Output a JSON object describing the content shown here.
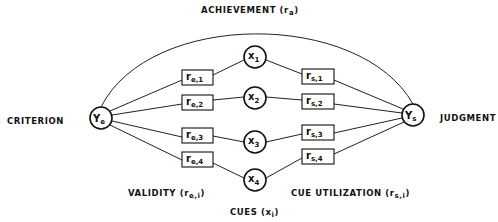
{
  "labels": {
    "achievement": "ACHIEVEMENT (r",
    "achievement_sub": "a",
    "achievement_close": ")",
    "criterion": "CRITERION",
    "judgment": "JUDGMENT",
    "validity": "VALIDITY (r",
    "validity_sub": "e,i",
    "validity_close": ")",
    "cue_utilization": "CUE UTILIZATION (r",
    "cue_utilization_sub": "s,i",
    "cue_utilization_close": ")",
    "cues": "CUES (x",
    "cues_sub": "i",
    "cues_close": ")"
  },
  "nodes": {
    "criterion_node": {
      "main": "Y",
      "sub": "e"
    },
    "judgment_node": {
      "main": "Y",
      "sub": "s"
    },
    "cues": [
      {
        "main": "x",
        "sub": "1"
      },
      {
        "main": "x",
        "sub": "2"
      },
      {
        "main": "x",
        "sub": "3"
      },
      {
        "main": "x",
        "sub": "4"
      }
    ]
  },
  "validity_boxes": [
    {
      "main": "r",
      "sub": "e,1"
    },
    {
      "main": "r",
      "sub": "e,2"
    },
    {
      "main": "r",
      "sub": "e,3"
    },
    {
      "main": "r",
      "sub": "e,4"
    }
  ],
  "utilization_boxes": [
    {
      "main": "r",
      "sub": "s,1"
    },
    {
      "main": "r",
      "sub": "s,2"
    },
    {
      "main": "r",
      "sub": "s,3"
    },
    {
      "main": "r",
      "sub": "s,4"
    }
  ]
}
